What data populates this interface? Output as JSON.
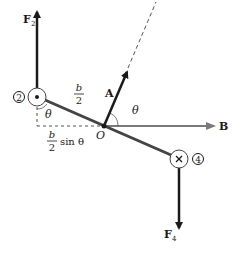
{
  "diagram": {
    "labels": {
      "force_2": "F",
      "force_2_sub": "2",
      "force_4": "F",
      "force_4_sub": "4",
      "vector_a": "A",
      "field_b": "B",
      "origin": "O",
      "theta_top": "θ",
      "theta_left": "θ",
      "half_b_num": "b",
      "half_b_den": "2",
      "proj_num": "b",
      "proj_den": "2",
      "proj_suffix": "sin θ",
      "conductor_2": "2",
      "conductor_4": "4"
    },
    "symbols": {
      "conductor_2_current": "out-of-page (dot)",
      "conductor_4_current": "into-page (cross)"
    },
    "colors": {
      "ink": "#1a1a1a",
      "field": "#7a7a7a",
      "loop": "#444444"
    }
  }
}
